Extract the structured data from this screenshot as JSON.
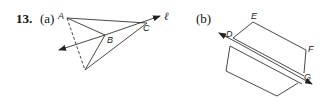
{
  "problem": {
    "number": "13.",
    "parts": [
      {
        "label": "(a)",
        "points": {
          "A": "A",
          "B": "B",
          "C": "C"
        },
        "line_label": "ℓ",
        "description": "Triangle ABC with a fourth vertex below; line ℓ through B and C with arrows; dashed segment from A to lower vertex"
      },
      {
        "label": "(b)",
        "points": {
          "D": "D",
          "E": "E",
          "F": "F",
          "G": "G"
        },
        "description": "Two parallelograms separated by a double line through D and G with arrows at both ends"
      }
    ]
  },
  "colors": {
    "stroke": "#333333",
    "text": "#111111"
  }
}
